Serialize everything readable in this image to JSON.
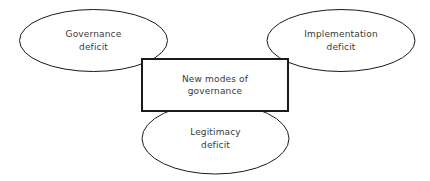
{
  "diagram": {
    "type": "concept-diagram",
    "background_color": "#ffffff",
    "stroke_color": "#1a1a1a",
    "text_color": "#3a3a3a",
    "center": {
      "shape": "rectangle",
      "line1": "New modes of",
      "line2": "governance",
      "stroke_width": 2
    },
    "nodes": [
      {
        "id": "governance-deficit",
        "shape": "ellipse",
        "position": "left",
        "line1": "Governance",
        "line2": "deficit",
        "stroke_width": 1
      },
      {
        "id": "implementation-deficit",
        "shape": "ellipse",
        "position": "right",
        "line1": "Implementation",
        "line2": "deficit",
        "stroke_width": 1
      },
      {
        "id": "legitimacy-deficit",
        "shape": "ellipse",
        "position": "bottom",
        "line1": "Legitimacy",
        "line2": "deficit",
        "stroke_width": 1
      }
    ]
  }
}
